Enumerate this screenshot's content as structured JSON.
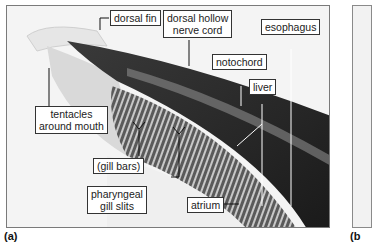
{
  "figure": {
    "panel_a": {
      "caption": "(a)",
      "labels": {
        "dorsal_fin": "dorsal fin",
        "dorsal_nerve_cord_1": "dorsal hollow",
        "dorsal_nerve_cord_2": "nerve cord",
        "esophagus": "esophagus",
        "notochord": "notochord",
        "liver": "liver",
        "tentacles_1": "tentacles",
        "tentacles_2": "around mouth",
        "gill_bars": "(gill bars)",
        "gill_slits_1": "pharyngeal",
        "gill_slits_2": "gill slits",
        "atrium": "atrium"
      }
    },
    "panel_b": {
      "caption": "(b"
    }
  }
}
